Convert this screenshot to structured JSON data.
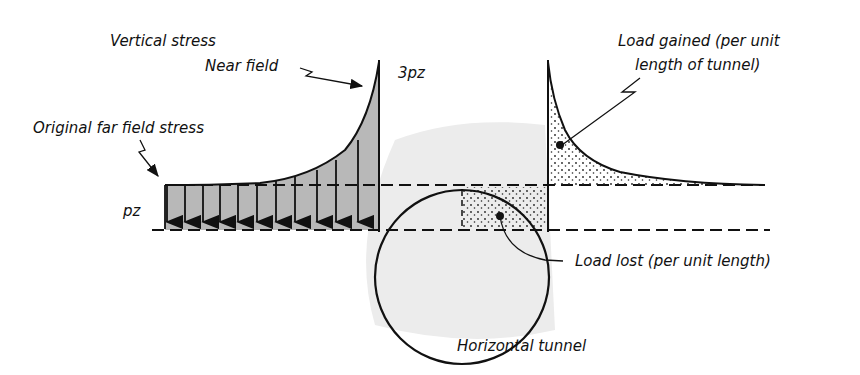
{
  "diagram": {
    "labels": {
      "vertical_stress": "Vertical stress",
      "near_field": "Near field",
      "peak": "3pz",
      "original_far_field": "Original far field stress",
      "far_field_value": "pz",
      "load_gained_line1": "Load gained (per unit",
      "load_gained_line2": "length of tunnel)",
      "load_lost": "Load lost (per unit length)",
      "tunnel": "Horizontal tunnel"
    },
    "colors": {
      "ink": "#111111",
      "stress_fill": "#b8b8b8",
      "halo": "#ececec",
      "stipple": "#222222"
    },
    "geometry": {
      "tunnel_center": [
        462,
        277
      ],
      "tunnel_radius": 87,
      "far_field_line_y": 185,
      "baseline_y": 230,
      "left_wall_x": 379,
      "right_wall_x": 548,
      "peak_y": 62,
      "arrow_count": 12
    }
  }
}
